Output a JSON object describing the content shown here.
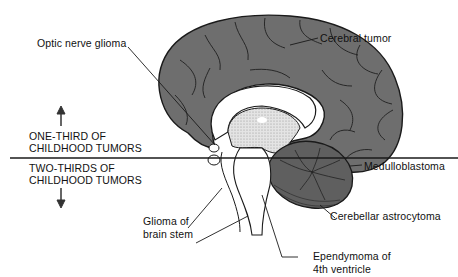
{
  "figure": {
    "labels": {
      "optic_nerve_glioma": "Optic nerve glioma",
      "cerebral_tumor": "Cerebral tumor",
      "medulloblastoma": "Medulloblastoma",
      "cerebellar_astrocytoma": "Cerebellar astrocytoma",
      "glioma_brain_stem_line1": "Glioma of",
      "glioma_brain_stem_line2": "brain stem",
      "ependymoma_line1": "Ependymoma of",
      "ependymoma_line2": "4th ventricle"
    },
    "divider": {
      "above_line1": "ONE-THIRD OF",
      "above_line2": "CHILDHOOD TUMORS",
      "below_line1": "TWO-THIRDS OF",
      "below_line2": "CHILDHOOD TUMORS"
    },
    "colors": {
      "cortex": "#6e6e6e",
      "outline": "#1a1a1a",
      "diencephalon": "#d9d9d9",
      "cerebellum": "#5f5f5f",
      "background": "#ffffff"
    }
  }
}
